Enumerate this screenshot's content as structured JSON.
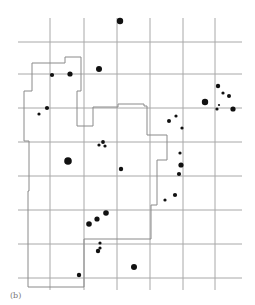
{
  "figure": {
    "caption": "(b)",
    "grid": {
      "color": "#a8a8a8",
      "vertical_x": [
        50,
        84,
        117,
        150,
        183,
        215
      ],
      "vertical_y_range": [
        18,
        290
      ],
      "horizontal_y": [
        42,
        74,
        108,
        142,
        176,
        210,
        244,
        278
      ],
      "horizontal_x_range": [
        18,
        242
      ]
    },
    "boundary": {
      "color": "#8a8a8a",
      "points": [
        [
          32,
          63
        ],
        [
          65,
          63
        ],
        [
          65,
          57
        ],
        [
          81,
          57
        ],
        [
          81,
          91
        ],
        [
          77,
          91
        ],
        [
          77,
          126
        ],
        [
          93,
          126
        ],
        [
          93,
          107
        ],
        [
          118,
          107
        ],
        [
          118,
          104
        ],
        [
          144,
          104
        ],
        [
          144,
          106
        ],
        [
          147,
          106
        ],
        [
          147,
          135
        ],
        [
          167,
          135
        ],
        [
          167,
          160
        ],
        [
          157,
          160
        ],
        [
          157,
          205
        ],
        [
          151,
          205
        ],
        [
          151,
          239
        ],
        [
          84,
          239
        ],
        [
          84,
          287
        ],
        [
          28,
          287
        ],
        [
          28,
          268
        ],
        [
          28,
          191
        ],
        [
          29,
          191
        ],
        [
          29,
          141
        ],
        [
          24,
          141
        ],
        [
          24,
          91
        ],
        [
          32,
          91
        ],
        [
          32,
          63
        ]
      ]
    },
    "dots": [
      {
        "x": 120,
        "y": 21,
        "r": 3.2
      },
      {
        "x": 99,
        "y": 69,
        "r": 3
      },
      {
        "x": 70,
        "y": 74,
        "r": 2.6
      },
      {
        "x": 52,
        "y": 75,
        "r": 2.1
      },
      {
        "x": 47,
        "y": 108,
        "r": 2.1
      },
      {
        "x": 39,
        "y": 114,
        "r": 1.6
      },
      {
        "x": 103,
        "y": 142,
        "r": 1.9
      },
      {
        "x": 99,
        "y": 145,
        "r": 1.6
      },
      {
        "x": 105,
        "y": 146,
        "r": 1.6
      },
      {
        "x": 68,
        "y": 161,
        "r": 3.8
      },
      {
        "x": 121,
        "y": 169,
        "r": 2.2
      },
      {
        "x": 218,
        "y": 86,
        "r": 2.2
      },
      {
        "x": 223,
        "y": 93,
        "r": 1.6
      },
      {
        "x": 229,
        "y": 96,
        "r": 2
      },
      {
        "x": 205,
        "y": 102,
        "r": 3.2
      },
      {
        "x": 219,
        "y": 105,
        "r": 1.1
      },
      {
        "x": 217,
        "y": 109,
        "r": 1.6
      },
      {
        "x": 233,
        "y": 109,
        "r": 2.6
      },
      {
        "x": 176,
        "y": 116,
        "r": 1.6
      },
      {
        "x": 169,
        "y": 121,
        "r": 2
      },
      {
        "x": 182,
        "y": 128,
        "r": 1.6
      },
      {
        "x": 180,
        "y": 153,
        "r": 1.6
      },
      {
        "x": 181,
        "y": 165,
        "r": 2.6
      },
      {
        "x": 179,
        "y": 174,
        "r": 2.1
      },
      {
        "x": 175,
        "y": 195,
        "r": 2.1
      },
      {
        "x": 165,
        "y": 200,
        "r": 1.6
      },
      {
        "x": 106,
        "y": 213,
        "r": 2.8
      },
      {
        "x": 97,
        "y": 219,
        "r": 2.6
      },
      {
        "x": 89,
        "y": 224,
        "r": 2.8
      },
      {
        "x": 100,
        "y": 243,
        "r": 1.6
      },
      {
        "x": 100,
        "y": 248,
        "r": 1.6
      },
      {
        "x": 98,
        "y": 251,
        "r": 2.2
      },
      {
        "x": 79,
        "y": 275,
        "r": 2.2
      },
      {
        "x": 134,
        "y": 267,
        "r": 3
      }
    ],
    "dot_color": "#111111"
  }
}
